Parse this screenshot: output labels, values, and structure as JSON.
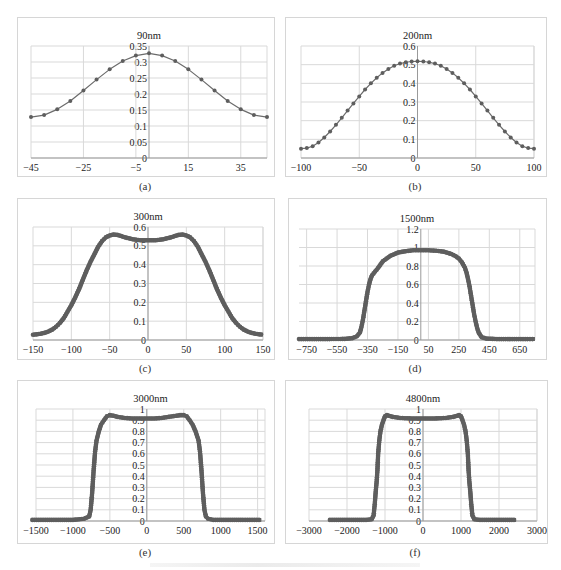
{
  "figure": {
    "panels": [
      {
        "id": "a",
        "caption": "(a)"
      },
      {
        "id": "b",
        "caption": "(b)"
      },
      {
        "id": "c",
        "caption": "(c)"
      },
      {
        "id": "d",
        "caption": "(d)"
      },
      {
        "id": "e",
        "caption": "(e)"
      },
      {
        "id": "f",
        "caption": "(f)"
      }
    ],
    "colors": {
      "line": "#6b6b6b",
      "marker": "#5e5e5e",
      "grid": "#d9d9d9",
      "frame": "#d6d6d6",
      "text": "#222222"
    }
  },
  "chart_data": [
    {
      "id": "a",
      "type": "line",
      "title": "90nm",
      "xlabel": "",
      "ylabel": "",
      "xlim": [
        -45,
        45
      ],
      "ylim": [
        0,
        0.35
      ],
      "xticks": [
        -45,
        -25,
        -5,
        15,
        35
      ],
      "xtick_labels": [
        "-45",
        "-25",
        "-5",
        "15",
        "35"
      ],
      "yticks": [
        0,
        0.05,
        0.1,
        0.15,
        0.2,
        0.25,
        0.3,
        0.35
      ],
      "ytick_labels": [
        "0",
        "0.05",
        "0.1",
        "0.15",
        "0.2",
        "0.25",
        "0.3",
        "0.35"
      ],
      "grid": true,
      "legend": false,
      "x": [
        -45,
        -40,
        -35,
        -30,
        -25,
        -20,
        -15,
        -10,
        -5,
        0,
        5,
        10,
        15,
        20,
        25,
        30,
        35,
        40,
        45
      ],
      "series": [
        {
          "name": "90nm",
          "values": [
            0.128,
            0.134,
            0.152,
            0.178,
            0.211,
            0.245,
            0.277,
            0.303,
            0.32,
            0.327,
            0.32,
            0.303,
            0.277,
            0.245,
            0.211,
            0.178,
            0.152,
            0.134,
            0.128
          ]
        }
      ]
    },
    {
      "id": "b",
      "type": "line",
      "title": "200nm",
      "xlabel": "",
      "ylabel": "",
      "xlim": [
        -100,
        100
      ],
      "ylim": [
        0,
        0.6
      ],
      "xticks": [
        -100,
        -50,
        0,
        50,
        100
      ],
      "xtick_labels": [
        "-100",
        "-50",
        "0",
        "50",
        "100"
      ],
      "yticks": [
        0,
        0.1,
        0.2,
        0.3,
        0.4,
        0.5,
        0.6
      ],
      "ytick_labels": [
        "0",
        "0.1",
        "0.2",
        "0.3",
        "0.4",
        "0.5",
        "0.6"
      ],
      "grid": true,
      "legend": false,
      "x": [
        -100,
        -95,
        -90,
        -85,
        -80,
        -75,
        -70,
        -65,
        -60,
        -55,
        -50,
        -45,
        -40,
        -35,
        -30,
        -25,
        -20,
        -15,
        -10,
        -5,
        0,
        5,
        10,
        15,
        20,
        25,
        30,
        35,
        40,
        45,
        50,
        55,
        60,
        65,
        70,
        75,
        80,
        85,
        90,
        95,
        100
      ],
      "series": [
        {
          "name": "200nm",
          "values": [
            0.05,
            0.053,
            0.063,
            0.083,
            0.11,
            0.142,
            0.178,
            0.215,
            0.254,
            0.292,
            0.33,
            0.367,
            0.4,
            0.43,
            0.456,
            0.477,
            0.494,
            0.506,
            0.513,
            0.517,
            0.518,
            0.517,
            0.513,
            0.506,
            0.494,
            0.477,
            0.456,
            0.43,
            0.4,
            0.367,
            0.33,
            0.292,
            0.254,
            0.215,
            0.178,
            0.142,
            0.11,
            0.083,
            0.063,
            0.053,
            0.05
          ]
        }
      ]
    },
    {
      "id": "c",
      "type": "line",
      "title": "300nm",
      "xlabel": "",
      "ylabel": "",
      "xlim": [
        -150,
        150
      ],
      "ylim": [
        0,
        0.6
      ],
      "xticks": [
        -150,
        -100,
        -50,
        0,
        50,
        100,
        150
      ],
      "xtick_labels": [
        "-150",
        "-100",
        "-50",
        "0",
        "50",
        "100",
        "150"
      ],
      "yticks": [
        0,
        0.1,
        0.2,
        0.3,
        0.4,
        0.5,
        0.6
      ],
      "ytick_labels": [
        "0",
        "0.1",
        "0.2",
        "0.3",
        "0.4",
        "0.5",
        "0.6"
      ],
      "grid": true,
      "legend": false,
      "x": [
        -150,
        -145,
        -140,
        -135,
        -130,
        -125,
        -120,
        -115,
        -110,
        -105,
        -100,
        -95,
        -90,
        -85,
        -80,
        -75,
        -70,
        -65,
        -60,
        -55,
        -50,
        -45,
        -40,
        -35,
        -30,
        -25,
        -20,
        -15,
        -10,
        -5,
        0,
        5,
        10,
        15,
        20,
        25,
        30,
        35,
        40,
        45,
        50,
        55,
        60,
        65,
        70,
        75,
        80,
        85,
        90,
        95,
        100,
        105,
        110,
        115,
        120,
        125,
        130,
        135,
        140,
        145,
        150
      ],
      "series": [
        {
          "name": "300nm",
          "values": [
            0.028,
            0.03,
            0.033,
            0.038,
            0.045,
            0.055,
            0.07,
            0.09,
            0.115,
            0.15,
            0.185,
            0.225,
            0.27,
            0.32,
            0.37,
            0.415,
            0.455,
            0.495,
            0.525,
            0.545,
            0.555,
            0.56,
            0.558,
            0.552,
            0.545,
            0.54,
            0.535,
            0.532,
            0.53,
            0.53,
            0.53,
            0.53,
            0.53,
            0.532,
            0.535,
            0.54,
            0.545,
            0.552,
            0.558,
            0.56,
            0.555,
            0.545,
            0.525,
            0.495,
            0.455,
            0.415,
            0.37,
            0.32,
            0.27,
            0.225,
            0.185,
            0.15,
            0.115,
            0.09,
            0.07,
            0.055,
            0.045,
            0.038,
            0.033,
            0.03,
            0.028
          ]
        }
      ]
    },
    {
      "id": "d",
      "type": "line",
      "title": "1500nm",
      "xlabel": "",
      "ylabel": "",
      "xlim": [
        -800,
        750
      ],
      "ylim": [
        0,
        1.2
      ],
      "xticks": [
        -750,
        -550,
        -350,
        -150,
        50,
        250,
        450,
        650
      ],
      "xtick_labels": [
        "-750",
        "-550",
        "-350",
        "-150",
        "50",
        "250",
        "450",
        "650"
      ],
      "yticks": [
        0,
        0.2,
        0.4,
        0.6,
        0.8,
        1,
        1.2
      ],
      "ytick_labels": [
        "0",
        "0.2",
        "0.4",
        "0.6",
        "0.8",
        "1",
        "1.2"
      ],
      "grid": true,
      "legend": false,
      "x": [
        -800,
        -700,
        -600,
        -500,
        -450,
        -420,
        -400,
        -390,
        -380,
        -370,
        -360,
        -350,
        -340,
        -330,
        -320,
        -300,
        -280,
        -250,
        -200,
        -150,
        -100,
        -50,
        0,
        50,
        100,
        150,
        200,
        230,
        250,
        270,
        290,
        300,
        310,
        320,
        330,
        340,
        350,
        360,
        370,
        380,
        400,
        430,
        500,
        600,
        700,
        750
      ],
      "series": [
        {
          "name": "1500nm",
          "values": [
            0.01,
            0.01,
            0.01,
            0.012,
            0.02,
            0.04,
            0.08,
            0.14,
            0.22,
            0.32,
            0.42,
            0.52,
            0.6,
            0.66,
            0.7,
            0.74,
            0.78,
            0.85,
            0.91,
            0.945,
            0.96,
            0.97,
            0.97,
            0.97,
            0.965,
            0.955,
            0.93,
            0.905,
            0.88,
            0.84,
            0.78,
            0.73,
            0.66,
            0.58,
            0.48,
            0.38,
            0.28,
            0.2,
            0.13,
            0.08,
            0.03,
            0.015,
            0.01,
            0.01,
            0.01,
            0.01
          ]
        }
      ]
    },
    {
      "id": "e",
      "type": "line",
      "title": "3000nm",
      "xlabel": "",
      "ylabel": "",
      "xlim": [
        -1500,
        1600
      ],
      "ylim": [
        0,
        1
      ],
      "xticks": [
        -1500,
        -1000,
        -500,
        0,
        500,
        1000,
        1500
      ],
      "xtick_labels": [
        "-1500",
        "-1000",
        "-500",
        "0",
        "500",
        "1000",
        "1500"
      ],
      "yticks": [
        0,
        0.1,
        0.2,
        0.3,
        0.4,
        0.5,
        0.6,
        0.7,
        0.8,
        0.9,
        1
      ],
      "ytick_labels": [
        "0",
        "0.1",
        "0.2",
        "0.3",
        "0.4",
        "0.5",
        "0.6",
        "0.7",
        "0.8",
        "0.9",
        "1"
      ],
      "grid": true,
      "legend": false,
      "x": [
        -1550,
        -1200,
        -1000,
        -850,
        -780,
        -760,
        -740,
        -720,
        -700,
        -680,
        -650,
        -620,
        -580,
        -540,
        -500,
        -450,
        -400,
        -300,
        -200,
        -100,
        0,
        100,
        200,
        300,
        400,
        450,
        500,
        540,
        580,
        620,
        660,
        700,
        720,
        740,
        760,
        780,
        800,
        830,
        900,
        1100,
        1300,
        1550
      ],
      "series": [
        {
          "name": "3000nm",
          "values": [
            0.01,
            0.01,
            0.01,
            0.02,
            0.04,
            0.1,
            0.25,
            0.45,
            0.62,
            0.72,
            0.8,
            0.86,
            0.9,
            0.935,
            0.945,
            0.94,
            0.93,
            0.92,
            0.915,
            0.915,
            0.915,
            0.915,
            0.92,
            0.93,
            0.94,
            0.945,
            0.945,
            0.935,
            0.9,
            0.86,
            0.8,
            0.72,
            0.62,
            0.45,
            0.25,
            0.1,
            0.04,
            0.02,
            0.01,
            0.01,
            0.01,
            0.01
          ]
        }
      ]
    },
    {
      "id": "f",
      "type": "line",
      "title": "4800nm",
      "xlabel": "",
      "ylabel": "",
      "xlim": [
        -3000,
        3000
      ],
      "ylim": [
        0,
        1
      ],
      "xticks": [
        -3000,
        -2000,
        -1000,
        0,
        1000,
        2000,
        3000
      ],
      "xtick_labels": [
        "-3000",
        "-2000",
        "-1000",
        "0",
        "1000",
        "2000",
        "3000"
      ],
      "yticks": [
        0,
        0.1,
        0.2,
        0.3,
        0.4,
        0.5,
        0.6,
        0.7,
        0.8,
        0.9,
        1
      ],
      "ytick_labels": [
        "0",
        "0.1",
        "0.2",
        "0.3",
        "0.4",
        "0.5",
        "0.6",
        "0.7",
        "0.8",
        "0.9",
        "1"
      ],
      "grid": true,
      "legend": false,
      "x": [
        -2450,
        -2000,
        -1500,
        -1350,
        -1300,
        -1270,
        -1240,
        -1220,
        -1200,
        -1180,
        -1150,
        -1120,
        -1080,
        -1040,
        -1000,
        -950,
        -900,
        -800,
        -600,
        -300,
        0,
        300,
        600,
        800,
        900,
        950,
        1000,
        1040,
        1080,
        1120,
        1150,
        1180,
        1200,
        1220,
        1240,
        1270,
        1300,
        1350,
        1500,
        2000,
        2450
      ],
      "series": [
        {
          "name": "4800nm",
          "values": [
            0.01,
            0.01,
            0.01,
            0.015,
            0.05,
            0.15,
            0.28,
            0.35,
            0.45,
            0.6,
            0.72,
            0.8,
            0.86,
            0.9,
            0.935,
            0.945,
            0.94,
            0.93,
            0.92,
            0.915,
            0.915,
            0.915,
            0.92,
            0.93,
            0.94,
            0.945,
            0.935,
            0.9,
            0.86,
            0.8,
            0.72,
            0.6,
            0.45,
            0.35,
            0.28,
            0.15,
            0.05,
            0.015,
            0.01,
            0.01,
            0.01
          ]
        }
      ]
    }
  ]
}
